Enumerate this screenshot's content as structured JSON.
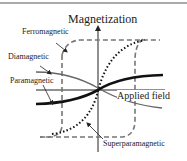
{
  "diagram": {
    "title": "Magnetization",
    "x_axis_label": "Applied field",
    "labels": {
      "ferromagnetic": "Ferromagnetic",
      "diamagnetic": "Diamagnetic",
      "paramagnetic": "Paramagnetic",
      "superparamagnetic": "Superparamagnetic"
    },
    "curves": [
      {
        "name": "Ferromagnetic",
        "style": "dashed gray hysteresis loop"
      },
      {
        "name": "Superparamagnetic",
        "style": "dotted black S-curve"
      },
      {
        "name": "Paramagnetic",
        "style": "solid thick black"
      },
      {
        "name": "Diamagnetic",
        "style": "solid thin gray, negative slope"
      }
    ]
  }
}
